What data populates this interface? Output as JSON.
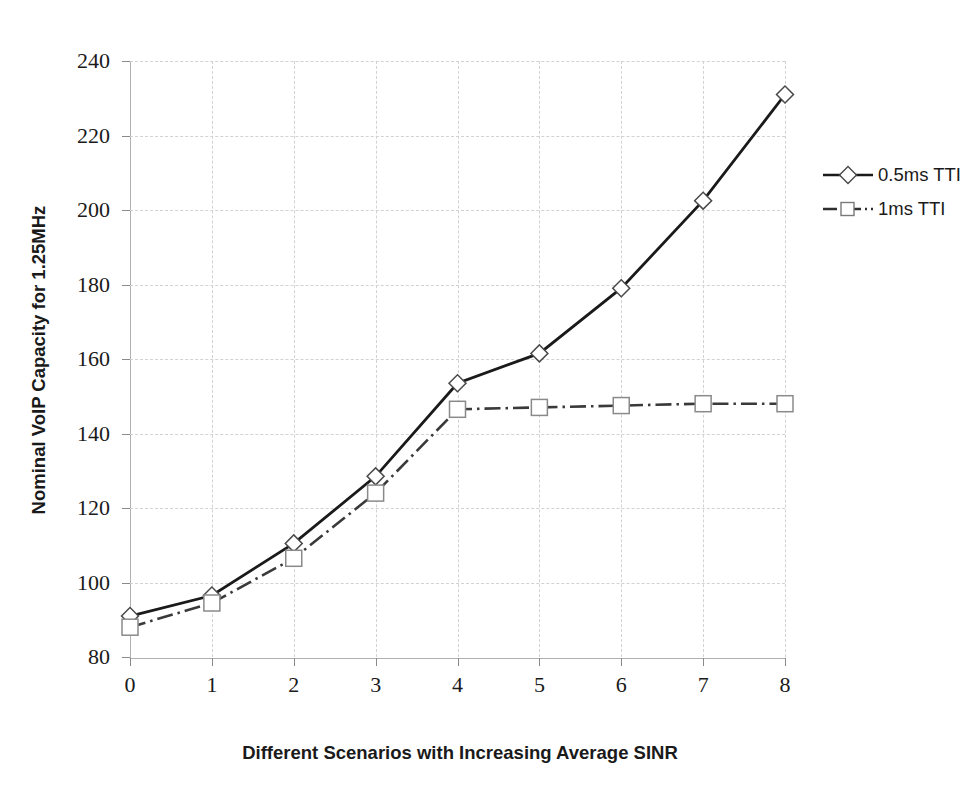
{
  "chart_data": {
    "type": "line",
    "title": "",
    "xlabel": "Different Scenarios with Increasing Average SINR",
    "ylabel": "Nominal VoIP Capacity for 1.25MHz",
    "x": [
      0,
      1,
      2,
      3,
      4,
      5,
      6,
      7,
      8
    ],
    "xtick_labels": [
      "0",
      "1",
      "2",
      "3",
      "4",
      "5",
      "6",
      "7",
      "8"
    ],
    "ytick_labels": [
      "80",
      "100",
      "120",
      "140",
      "160",
      "180",
      "200",
      "220",
      "240"
    ],
    "yticks": [
      80,
      100,
      120,
      140,
      160,
      180,
      200,
      220,
      240
    ],
    "xlim": [
      0,
      8
    ],
    "ylim": [
      80,
      240
    ],
    "grid": true,
    "legend_position": "right",
    "series": [
      {
        "name": "0.5ms TTI",
        "values": [
          91,
          96.5,
          110.5,
          128.5,
          153.5,
          161.5,
          179,
          202.5,
          231
        ],
        "marker": "diamond",
        "line_style": "solid",
        "color": "#1a1a1a"
      },
      {
        "name": "1ms TTI",
        "values": [
          88,
          94.5,
          106.5,
          124,
          146.5,
          147,
          147.5,
          148,
          148
        ],
        "marker": "square",
        "line_style": "dash-dot",
        "color": "#3a3a3a"
      }
    ]
  },
  "legend": {
    "items": [
      {
        "label": "0.5ms TTI"
      },
      {
        "label": "1ms TTI"
      }
    ]
  },
  "axes": {
    "y_title": "Nominal VoIP Capacity for 1.25MHz",
    "x_title": "Different Scenarios with Increasing Average SINR"
  },
  "colors": {
    "series_1": "#1a1a1a",
    "series_2": "#3a3a3a",
    "gridline": "#d2d2d2",
    "axis": "#b0b0b0",
    "text": "#1a1a1a",
    "background": "#ffffff"
  }
}
